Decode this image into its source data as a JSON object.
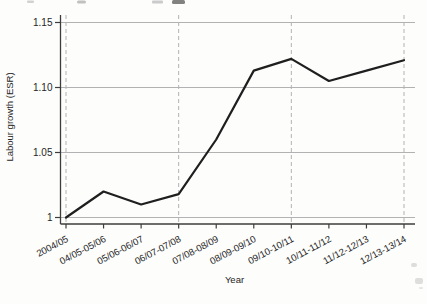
{
  "figure": {
    "background": "#fdfdfc"
  },
  "chart_data": {
    "type": "line",
    "title": "",
    "xlabel": "Year",
    "ylabel": "Labour growth (ESR)",
    "categories": [
      "2004/05",
      "04/05-05/06",
      "05/06-06/07",
      "06/07-07/08",
      "07/08-08/09",
      "08/09-09/10",
      "09/10-10/11",
      "10/11-11/12",
      "11/12-12/13",
      "12/13-13/14"
    ],
    "values": [
      1.0,
      1.02,
      1.01,
      1.018,
      1.06,
      1.113,
      1.122,
      1.105,
      1.113,
      1.121
    ],
    "series_name": "Labour growth (ESR)",
    "yticks": [
      1,
      1.05,
      1.1,
      1.15
    ],
    "ytick_labels": [
      "1",
      "1.05",
      "1.10",
      "1.15"
    ],
    "ylim": [
      0.995,
      1.156
    ],
    "legend": "none",
    "grid": {
      "horizontal": "solid",
      "vertical": "dashed",
      "vertical_at_category_indexes": [
        0,
        3,
        6,
        9
      ]
    },
    "line_color": "#1f1f1f",
    "grid_color": "#b2b2b2",
    "axis_color": "#3d3d3d",
    "text_color": "#262626"
  }
}
